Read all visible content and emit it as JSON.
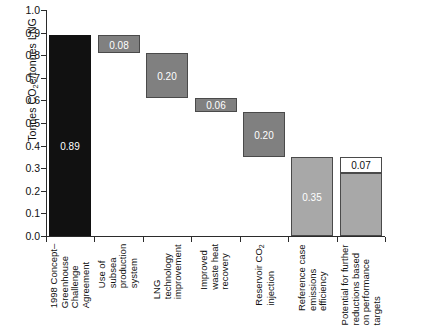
{
  "chart_data": {
    "type": "bar",
    "subtype": "waterfall",
    "title": "",
    "xlabel": "",
    "ylabel": "Tonnes CO2e/tonnes LNG",
    "ylim": [
      0.0,
      1.0
    ],
    "ytick_labels": [
      "0.0",
      "0.1",
      "0.2",
      "0.3",
      "0.4",
      "0.5",
      "0.6",
      "0.7",
      "0.8",
      "0.9",
      "1.0"
    ],
    "ytick_values": [
      0.0,
      0.1,
      0.2,
      0.3,
      0.4,
      0.5,
      0.6,
      0.7,
      0.8,
      0.9,
      1.0
    ],
    "grid": false,
    "legend": "none",
    "categories": [
      "1998 Concept–Greenhouse Challenge Agreement",
      "Use of subsea production system",
      "LNG technology improvement",
      "Improved waste heat recovery",
      "Reservoir CO2 injection",
      "Reference case emissions efficiency",
      "Potential for further reductions based on performance targets"
    ],
    "values": [
      0.89,
      0.08,
      0.2,
      0.06,
      0.2,
      0.35,
      0.07
    ],
    "data_labels": [
      "0.89",
      "0.08",
      "0.20",
      "0.06",
      "0.20",
      "0.35",
      "0.07"
    ],
    "bars": [
      {
        "label": "1998 Concept–Greenhouse Challenge Agreement",
        "value": 0.89,
        "base": 0.0,
        "top": 0.89,
        "data_label": "0.89",
        "color": "#111111",
        "kind": "total"
      },
      {
        "label": "Use of subsea production system",
        "value": 0.08,
        "base": 0.81,
        "top": 0.89,
        "data_label": "0.08",
        "color": "#808080",
        "kind": "decrement"
      },
      {
        "label": "LNG technology improvement",
        "value": 0.2,
        "base": 0.61,
        "top": 0.81,
        "data_label": "0.20",
        "color": "#808080",
        "kind": "decrement"
      },
      {
        "label": "Improved waste heat recovery",
        "value": 0.06,
        "base": 0.55,
        "top": 0.61,
        "data_label": "0.06",
        "color": "#808080",
        "kind": "decrement"
      },
      {
        "label": "Reservoir CO2 injection",
        "value": 0.2,
        "base": 0.35,
        "top": 0.55,
        "data_label": "0.20",
        "color": "#808080",
        "kind": "decrement"
      },
      {
        "label": "Reference case emissions efficiency",
        "value": 0.35,
        "base": 0.0,
        "top": 0.35,
        "data_label": "0.35",
        "color": "#a8a8a8",
        "kind": "total"
      },
      {
        "label": "Potential for further reductions based on performance targets",
        "value": 0.07,
        "base": 0.28,
        "top": 0.35,
        "data_label": "0.07",
        "color": "#ffffff",
        "kind": "potential",
        "stacked_below": {
          "value": 0.28,
          "base": 0.0,
          "top": 0.28,
          "color": "#a8a8a8"
        }
      }
    ]
  },
  "axis": {
    "y_title_prefix": "Tonnes CO",
    "y_title_sub": "2",
    "y_title_suffix": "e/tonnes LNG"
  },
  "xlabels": [
    {
      "lines": [
        "1998 Concept–",
        "Greenhouse",
        "Challenge",
        "Agreement"
      ]
    },
    {
      "lines": [
        "Use of",
        "subsea",
        "production",
        "system"
      ]
    },
    {
      "lines": [
        "LNG",
        "technology",
        "improvement"
      ]
    },
    {
      "lines": [
        "Improved",
        "waste heat",
        "recovery"
      ]
    },
    {
      "lines": [
        "Reservoir CO",
        "injection"
      ],
      "sub_on_line": 0,
      "sub_text": "2"
    },
    {
      "lines": [
        "Reference case",
        "emissions",
        "efficiency"
      ]
    },
    {
      "lines": [
        "Potential for further",
        "reductions based",
        "on performance",
        "targets"
      ]
    }
  ],
  "colors": {
    "bar_total_dark": "#111111",
    "bar_decrement": "#808080",
    "bar_light": "#a8a8a8",
    "bar_potential": "#ffffff",
    "axis": "#2b2b2b",
    "text": "#111111",
    "background": "#ffffff"
  }
}
